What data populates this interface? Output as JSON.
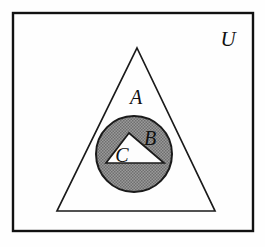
{
  "figure": {
    "background_color": "#fefefe",
    "width": 265,
    "height": 247
  },
  "universe": {
    "label": "U",
    "shape": "rectangle",
    "border_color": "#111111",
    "fill_color": "#fefefe",
    "bounds": {
      "x": 13,
      "y": 13,
      "width": 240,
      "height": 218
    },
    "label_position": {
      "x": 228,
      "y": 46
    }
  },
  "sets": [
    {
      "key": "A",
      "label": "A",
      "shape": "triangle",
      "fill_color": "#fefefe",
      "stroke_color": "#1a1a1a",
      "stroke_width": 1.6,
      "points": "137,48 215,211 57,211",
      "label_position": {
        "x": 136,
        "y": 104
      }
    },
    {
      "key": "B",
      "label": "B",
      "shape": "circle",
      "fill_color": "#8a8a8a",
      "stroke_color": "#1a1a1a",
      "stroke_width": 1.8,
      "center": {
        "x": 134,
        "y": 154
      },
      "radius": 38,
      "label_position": {
        "x": 144,
        "y": 144
      }
    },
    {
      "key": "C",
      "label": "C",
      "shape": "triangle",
      "fill_color": "#fdfdfd",
      "stroke_color": "#1a1a1a",
      "stroke_width": 1.6,
      "points": "129,133 164,163 106,163",
      "label_position": {
        "x": 114,
        "y": 162
      }
    }
  ],
  "relations": {
    "description": "C is a subset of B, B is a subset of A, A is a subset of U"
  },
  "colors": {
    "ink": "#111111",
    "shaded_fill": "#8a8a8a",
    "paper": "#fefefe"
  }
}
